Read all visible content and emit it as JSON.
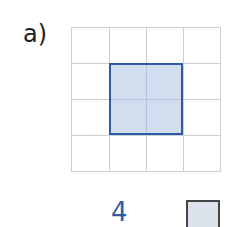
{
  "exercise": {
    "label": "a)",
    "grid": {
      "columns": 4,
      "rows": 4
    },
    "shape": {
      "type": "square",
      "col_start": 1,
      "row_start": 1,
      "width_cells": 2,
      "height_cells": 2,
      "fill": "#d3ddf0",
      "stroke": "#2f5aa8"
    },
    "answer": "4",
    "unit_icon": "unit-square-icon"
  }
}
